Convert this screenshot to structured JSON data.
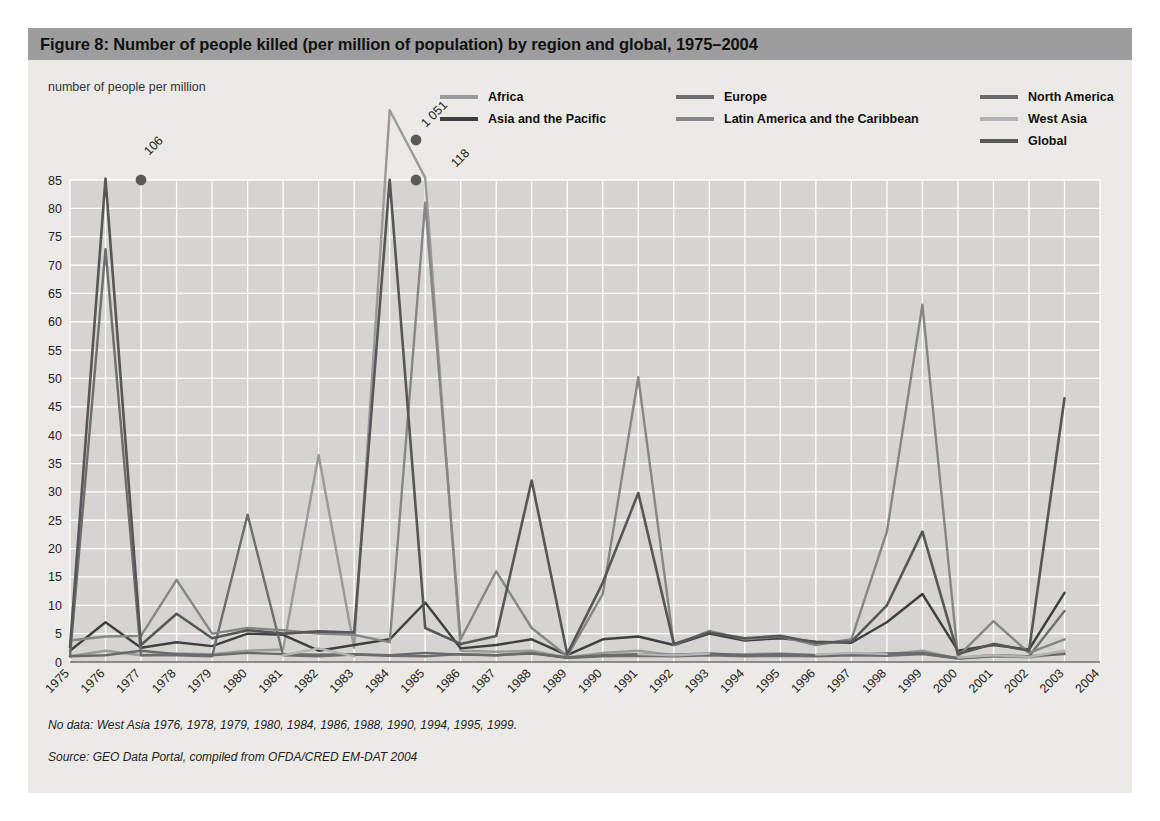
{
  "figure": {
    "title": "Figure 8: Number of people killed (per million of population) by region and global, 1975–2004",
    "axis_caption": "number of people per million",
    "note_no_data": "No data: West Asia 1976, 1978, 1979, 1980, 1984, 1986, 1988, 1990, 1994, 1995, 1999.",
    "note_source": "Source: GEO Data Portal, compiled from OFDA/CRED EM-DAT 2004",
    "title_bar_color": "#9d9d9d",
    "panel_color": "#eceae6",
    "plot_bg_color": "#d6d4d0",
    "gridline_color": "#ffffff"
  },
  "legend": {
    "columns": [
      {
        "x": 0,
        "y": 0,
        "items": [
          {
            "label": "Africa",
            "color": "#9a9a9a"
          },
          {
            "label": "Asia and the Pacific",
            "color": "#3f3f3f"
          }
        ]
      },
      {
        "x": 236,
        "y": 0,
        "items": [
          {
            "label": "Europe",
            "color": "#6e6e6e"
          },
          {
            "label": "Latin America and the Caribbean",
            "color": "#868686"
          }
        ]
      },
      {
        "x": 540,
        "y": 0,
        "items": [
          {
            "label": "North America",
            "color": "#6a6a6a"
          },
          {
            "label": "West Asia",
            "color": "#b4b4b4"
          },
          {
            "label": "Global",
            "color": "#575757"
          }
        ]
      }
    ]
  },
  "chart_data": {
    "type": "line",
    "title": "Figure 8: Number of people killed (per million of population) by region and global, 1975–2004",
    "xlabel": "",
    "ylabel": "number of people per million",
    "ylim": [
      0,
      89
    ],
    "yticks": [
      0,
      5,
      10,
      15,
      20,
      25,
      30,
      35,
      40,
      45,
      50,
      55,
      60,
      65,
      70,
      75,
      80,
      85
    ],
    "grid": true,
    "legend_position": "top",
    "x": [
      1975,
      1976,
      1977,
      1978,
      1979,
      1980,
      1981,
      1982,
      1983,
      1984,
      1985,
      1986,
      1987,
      1988,
      1989,
      1990,
      1991,
      1992,
      1993,
      1994,
      1995,
      1996,
      1997,
      1998,
      1999,
      2000,
      2001,
      2002,
      2003,
      2004
    ],
    "categories": [
      "1975",
      "1976",
      "1977",
      "1978",
      "1979",
      "1980",
      "1981",
      "1982",
      "1983",
      "1984",
      "1985",
      "1986",
      "1987",
      "1988",
      "1989",
      "1990",
      "1991",
      "1992",
      "1993",
      "1994",
      "1995",
      "1996",
      "1997",
      "1998",
      "1999",
      "2000",
      "2001",
      "2002",
      "2003",
      "2004"
    ],
    "annotations": [
      {
        "text": "106",
        "year": 1976,
        "value": 106,
        "series": "Global"
      },
      {
        "text": "1 051",
        "year": 1984,
        "value": 1051,
        "series": "Africa"
      },
      {
        "text": "118",
        "year": 1985,
        "value": 118,
        "series": "Africa"
      }
    ],
    "series": [
      {
        "name": "Africa",
        "color": "#9a9a9a",
        "width": 2.4,
        "values": [
          1.0,
          2.0,
          1.2,
          1.5,
          1.4,
          2.0,
          2.2,
          36.5,
          2.5,
          1051,
          118,
          2.0,
          1.8,
          2.0,
          0.8,
          1.6,
          2.0,
          1.2,
          1.4,
          1.4,
          1.5,
          1.2,
          1.5,
          1.4,
          2.0,
          0.6,
          1.0,
          0.8,
          1.6,
          null
        ]
      },
      {
        "name": "Asia and the Pacific",
        "color": "#3f3f3f",
        "width": 2.4,
        "values": [
          2.0,
          7.0,
          2.5,
          3.5,
          2.8,
          5.0,
          4.8,
          2.0,
          3.0,
          4.0,
          10.5,
          2.4,
          3.0,
          4.0,
          1.2,
          4.0,
          4.5,
          3.0,
          5.0,
          3.8,
          4.2,
          3.6,
          3.4,
          7.0,
          12.0,
          2.0,
          3.0,
          2.2,
          12.2,
          null
        ]
      },
      {
        "name": "Europe",
        "color": "#6e6e6e",
        "width": 2.4,
        "values": [
          1.0,
          72.8,
          1.2,
          1.2,
          1.0,
          26.0,
          1.2,
          1.0,
          1.3,
          1.1,
          1.0,
          1.4,
          1.2,
          1.6,
          0.7,
          1.0,
          1.1,
          1.0,
          1.2,
          1.0,
          1.1,
          1.0,
          1.2,
          1.1,
          1.4,
          0.6,
          1.0,
          1.0,
          9.0,
          null
        ]
      },
      {
        "name": "Latin America and the Caribbean",
        "color": "#868686",
        "width": 2.4,
        "values": [
          3.8,
          4.5,
          4.6,
          14.5,
          5.0,
          6.0,
          5.6,
          5.0,
          4.8,
          3.5,
          81.0,
          4.0,
          16.0,
          6.0,
          1.0,
          12.0,
          50.2,
          3.0,
          5.5,
          4.0,
          4.5,
          3.0,
          4.0,
          23.0,
          63.0,
          1.0,
          7.2,
          1.6,
          4.0,
          null
        ]
      },
      {
        "name": "North America",
        "color": "#6a6a6a",
        "width": 2.4,
        "values": [
          1.0,
          1.2,
          2.0,
          1.4,
          1.2,
          1.6,
          1.4,
          1.3,
          1.4,
          1.2,
          1.6,
          1.3,
          1.2,
          1.5,
          0.8,
          1.2,
          1.4,
          1.3,
          1.5,
          1.2,
          1.4,
          1.2,
          1.3,
          1.5,
          1.6,
          0.7,
          1.2,
          1.0,
          1.4,
          null
        ]
      },
      {
        "name": "West Asia",
        "color": "#b4b4b4",
        "width": 2.4,
        "values": [
          0.8,
          null,
          1.0,
          null,
          null,
          null,
          1.2,
          2.4,
          1.0,
          null,
          1.4,
          null,
          1.6,
          null,
          0.9,
          null,
          1.4,
          1.2,
          1.5,
          null,
          null,
          1.3,
          1.6,
          1.4,
          null,
          0.8,
          1.2,
          0.9,
          2.0,
          null
        ]
      },
      {
        "name": "Global",
        "color": "#575757",
        "width": 2.6,
        "values": [
          2.6,
          106,
          3.0,
          8.5,
          4.2,
          5.6,
          5.0,
          5.4,
          5.2,
          89.0,
          6.0,
          3.2,
          4.6,
          32.0,
          1.4,
          14.0,
          29.8,
          3.2,
          5.2,
          4.2,
          4.6,
          3.4,
          3.6,
          10.0,
          23.0,
          1.4,
          3.2,
          2.0,
          46.5,
          null
        ]
      }
    ]
  }
}
